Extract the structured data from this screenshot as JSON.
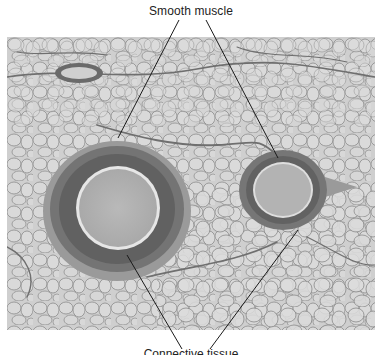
{
  "figure": {
    "type": "histology micrograph (grayscale)",
    "labels": {
      "top": "Smooth muscle",
      "bottom": "Connective tissue"
    },
    "bottom_label_visible_fraction": "truncated at image edge",
    "colors": {
      "background": "#ffffff",
      "tissue_base": "#c9c9c9",
      "adipocyte": "#d6d6d6",
      "septa": "#7a7a7a",
      "muscle_wall": "#6e6e6e",
      "lumen": "#b4b4b4",
      "leader_line": "#1a1a1a"
    }
  }
}
